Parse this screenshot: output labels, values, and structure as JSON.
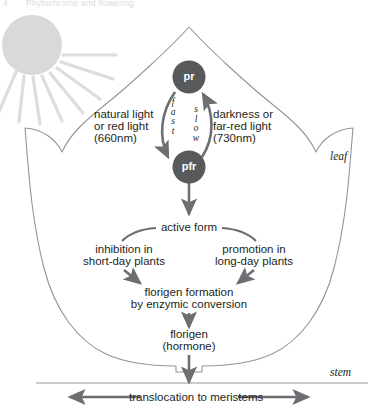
{
  "header": {
    "number": "4",
    "title": "Phytochrome and flowering"
  },
  "colors": {
    "node_fill": "#58595b",
    "node_text": "#ffffff",
    "leaf_outline": "#808285",
    "arrow_gray": "#6d6e71",
    "sun_fill": "#d9d9d9",
    "text": "#231f20",
    "header_text": "#dcdcdc"
  },
  "diagram": {
    "sun": {
      "name": "sun"
    },
    "leaf_label": "leaf",
    "stem_label": "stem",
    "nodes": {
      "pr": "pr",
      "pfr": "pfr"
    },
    "conversion": {
      "fast_label": "f\na\ns\nt",
      "slow_label": "s\nl\no\nw",
      "fast_plain": "fast",
      "slow_plain": "slow"
    },
    "left_stimulus": {
      "line1": "natural light",
      "line2": "or red light",
      "line3": "(660nm)"
    },
    "right_stimulus": {
      "line1": "darkness or",
      "line2": "far-red light",
      "line3": "(730nm)"
    },
    "active_form": "active form",
    "branch_left": {
      "line1": "inhibition in",
      "line2": "short-day plants"
    },
    "branch_right": {
      "line1": "promotion in",
      "line2": "long-day plants"
    },
    "florigen_formation": {
      "line1": "florigen formation",
      "line2": "by enzymic conversion"
    },
    "florigen": {
      "line1": "florigen",
      "line2": "(hormone)"
    },
    "translocation": "translocation to meristems"
  }
}
